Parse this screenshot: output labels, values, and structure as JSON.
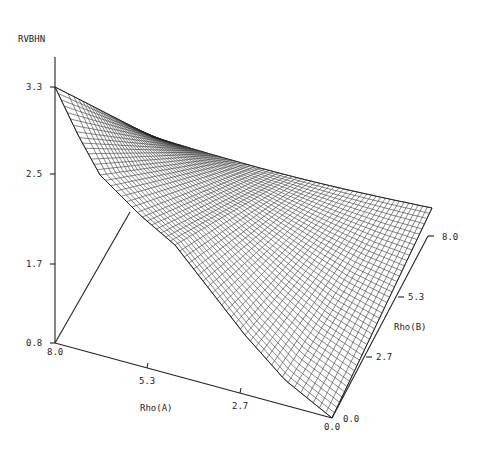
{
  "chart_data": {
    "type": "surface3d",
    "title": "",
    "zlabel": "RVBHN",
    "xlabel": "Rho(A)",
    "ylabel": "Rho(B)",
    "z_ticks": [
      "0.8",
      "1.7",
      "2.5",
      "3.3"
    ],
    "x_ticks": [
      "8.0",
      "5.3",
      "2.7",
      "0.0"
    ],
    "y_ticks": [
      "0.0",
      "2.7",
      "5.3",
      "8.0"
    ],
    "zlim": [
      0.8,
      3.3
    ],
    "xlim": [
      0.0,
      8.0
    ],
    "ylim": [
      0.0,
      8.0
    ],
    "grid": false,
    "legend": null,
    "surface_description": "Wireframe mesh; maximum ~3.3 at Rho(A)=8.0, Rho(B)=0.0; sharp valley/ridge near Rho(A)~6, Rho(B)~1 at ~2.2; broad plane sloping from ~2.9 at back (Rho(B)=8, Rho(A)=8) to ~2.3 at Rho(A)=0, Rho(B)=8 and down to 0.8 at Rho(A)=0, Rho(B)=0",
    "corner_values": [
      {
        "rho_a": 8.0,
        "rho_b": 0.0,
        "z": 3.3
      },
      {
        "rho_a": 8.0,
        "rho_b": 8.0,
        "z": 2.9
      },
      {
        "rho_a": 0.0,
        "rho_b": 8.0,
        "z": 2.3
      },
      {
        "rho_a": 0.0,
        "rho_b": 0.0,
        "z": 0.8
      }
    ]
  },
  "labels": {
    "z_axis": "RVBHN",
    "x_axis": "Rho(A)",
    "y_axis": "Rho(B)",
    "z_tick_33": "3.3",
    "z_tick_25": "2.5",
    "z_tick_17": "1.7",
    "z_tick_08": "0.8",
    "x_tick_80": "8.0",
    "x_tick_53": "5.3",
    "x_tick_27": "2.7",
    "x_tick_00": "0.0",
    "y_tick_00": "0.0",
    "y_tick_27": "2.7",
    "y_tick_53": "5.3",
    "y_tick_80": "8.0"
  }
}
